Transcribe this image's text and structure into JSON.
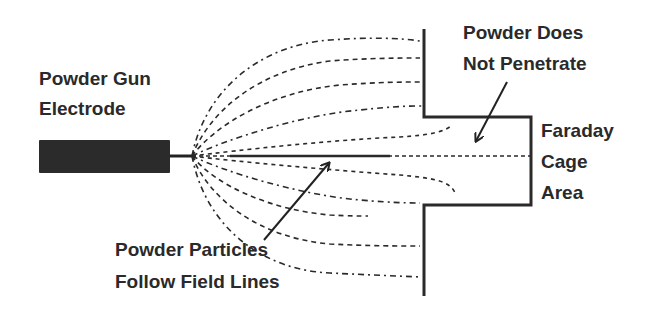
{
  "diagram": {
    "labels": {
      "electrode": {
        "line1": "Powder Gun",
        "line2": "Electrode"
      },
      "no_penetrate": {
        "line1": "Powder Does",
        "line2": "Not Penetrate"
      },
      "faraday": {
        "line1": "Faraday",
        "line2": "Cage",
        "line3": "Area"
      },
      "particles": {
        "line1": "Powder Particles",
        "line2": "Follow Field Lines"
      }
    },
    "colors": {
      "stroke": "#222222",
      "electrode_fill": "#2b2b2b",
      "text": "#2a2a2a",
      "background": "#ffffff"
    },
    "elements": [
      {
        "id": "electrode",
        "type": "rect",
        "desc": "Powder gun electrode body"
      },
      {
        "id": "grounded-part",
        "type": "polyline",
        "desc": "Grounded workpiece with recessed cavity (Faraday cage)"
      },
      {
        "id": "field-lines",
        "type": "dashed-curves",
        "count": 11,
        "desc": "Electric field lines from electrode tip to part"
      },
      {
        "id": "arrow-no-penetrate",
        "type": "arrow"
      },
      {
        "id": "arrow-particles",
        "type": "arrow"
      }
    ]
  }
}
